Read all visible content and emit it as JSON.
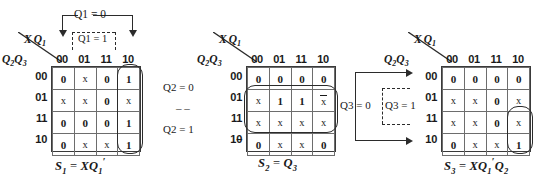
{
  "maps": [
    {
      "id": "map-s1",
      "col_axis_label": "XQ1",
      "row_axis_label": "Q2Q3",
      "col_headers": [
        "00",
        "01",
        "11",
        "10"
      ],
      "row_headers": [
        "00",
        "01",
        "11",
        "10"
      ],
      "cells": [
        [
          "0",
          "x",
          "0",
          "1"
        ],
        [
          "x",
          "x",
          "0",
          "x"
        ],
        [
          "0",
          "0",
          "0",
          "1"
        ],
        [
          "0",
          "x",
          "x",
          "1"
        ]
      ],
      "formula": "S1 = XQ1'",
      "annotations": [
        {
          "label": "Q1 = 0",
          "style": "solid"
        },
        {
          "label": "Q1 = 1",
          "style": "dashed"
        }
      ]
    },
    {
      "id": "map-s2",
      "col_axis_label": "XQ1",
      "row_axis_label": "Q2Q3",
      "col_headers": [
        "00",
        "01",
        "11",
        "10"
      ],
      "row_headers": [
        "00",
        "01",
        "11",
        "10"
      ],
      "cells": [
        [
          "0",
          "0",
          "0",
          "0"
        ],
        [
          "x",
          "1",
          "1",
          "x̅"
        ],
        [
          "x",
          "x",
          "x",
          "x"
        ],
        [
          "0",
          "x",
          "x",
          "0"
        ]
      ],
      "formula": "S2 = Q3",
      "annotations": [
        {
          "label": "Q2 = 0",
          "style": "solid"
        },
        {
          "label": "- -",
          "style": "dashes"
        },
        {
          "label": "Q2 = 1",
          "style": "solid"
        }
      ]
    },
    {
      "id": "map-s3",
      "col_axis_label": "XQ1",
      "row_axis_label": "Q2Q3",
      "col_headers": [
        "00",
        "01",
        "11",
        "10"
      ],
      "row_headers": [
        "00",
        "01",
        "11",
        "10"
      ],
      "cells": [
        [
          "0",
          "0",
          "0",
          "0"
        ],
        [
          "x",
          "x",
          "0",
          "x"
        ],
        [
          "x",
          "x",
          "0",
          "x"
        ],
        [
          "0",
          "x",
          "x",
          "1"
        ]
      ],
      "formula": "S3 = XQ1'Q2",
      "annotations": [
        {
          "label": "Q3 = 0",
          "style": "solid"
        },
        {
          "label": "Q3 = 1",
          "style": "dashed"
        }
      ]
    }
  ],
  "text": {
    "q1_eq_0": "Q1 = 0",
    "q1_eq_1": "Q1 = 1",
    "q2_eq_0": "Q2 = 0",
    "q2_dashes": "– –",
    "q2_eq_1": "Q2 = 1",
    "q3_eq_0": "Q3 = 0",
    "q3_eq_1": "Q3 = 1",
    "row_suffix_dash": "–"
  },
  "colors": {
    "ink": "#1a1a1a",
    "line": "#2b2b2b",
    "grid": "#6d6d6d",
    "background": "#ffffff"
  }
}
